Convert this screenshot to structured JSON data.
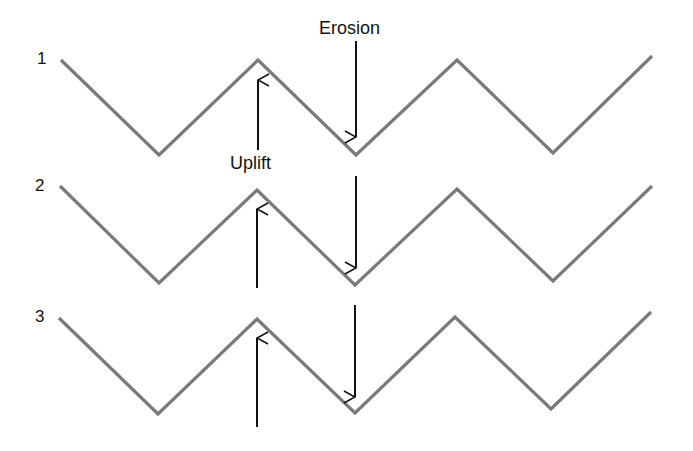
{
  "diagram": {
    "title": "",
    "colors": {
      "profile_line": "#7a7a7a",
      "arrow": "#111111",
      "text": "#111111",
      "background": "#ffffff"
    },
    "labels": {
      "erosion": "Erosion",
      "uplift": "Uplift"
    },
    "rows": [
      {
        "number": "1",
        "profile_points": [
          [
            61,
            60
          ],
          [
            159,
            155
          ],
          [
            258,
            60
          ],
          [
            356,
            155
          ],
          [
            457,
            60
          ],
          [
            553,
            153
          ],
          [
            652,
            56
          ]
        ],
        "uplift_arrow": {
          "x": 258,
          "y_from": 150,
          "y_to": 80
        },
        "erosion_arrow": {
          "x": 356,
          "y_from": 41,
          "y_to": 137
        }
      },
      {
        "number": "2",
        "profile_points": [
          [
            60,
            186
          ],
          [
            159,
            283
          ],
          [
            257,
            190
          ],
          [
            355,
            285
          ],
          [
            457,
            189
          ],
          [
            553,
            281
          ],
          [
            652,
            186
          ]
        ],
        "uplift_arrow": {
          "x": 257,
          "y_from": 288,
          "y_to": 209
        },
        "erosion_arrow": {
          "x": 356,
          "y_from": 176,
          "y_to": 268
        }
      },
      {
        "number": "3",
        "profile_points": [
          [
            59,
            318
          ],
          [
            158,
            414
          ],
          [
            257,
            319
          ],
          [
            355,
            413
          ],
          [
            455,
            317
          ],
          [
            551,
            409
          ],
          [
            651,
            312
          ]
        ],
        "uplift_arrow": {
          "x": 257,
          "y_from": 427,
          "y_to": 338
        },
        "erosion_arrow": {
          "x": 355,
          "y_from": 305,
          "y_to": 397
        }
      }
    ]
  }
}
